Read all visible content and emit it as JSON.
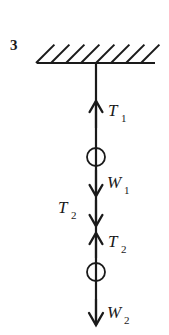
{
  "figure": {
    "number_label": "3",
    "type": "free-body-diagram",
    "canvas": {
      "width": 169,
      "height": 335,
      "background": "#ffffff"
    },
    "ink_color": "#1a1a1a"
  },
  "ceiling": {
    "name": "hatched-ceiling",
    "line": {
      "x1": 37,
      "y1": 63,
      "x2": 155,
      "y2": 63,
      "stroke_width": 2.2
    },
    "hatch": {
      "count": 8,
      "angle_degrees": 45,
      "length": 26,
      "spacing": 15,
      "start_x": 36,
      "stroke_width": 2.0
    }
  },
  "rod": {
    "name": "vertical-string",
    "x": 96,
    "y_top": 63,
    "y_bottom": 325,
    "stroke_width": 2.2
  },
  "masses": [
    {
      "name": "upper-mass",
      "cx": 96,
      "cy": 157,
      "r": 9,
      "stroke_width": 1.8
    },
    {
      "name": "lower-mass",
      "cx": 96,
      "cy": 272,
      "r": 9,
      "stroke_width": 1.8
    }
  ],
  "forces": [
    {
      "id": "T1",
      "name": "tension-T1",
      "symbol": "T",
      "subscript": "1",
      "direction": "up",
      "meaning": "Tension in upper string supporting both masses",
      "shaft": {
        "x": 96,
        "y_tail": 128,
        "y_head": 101
      },
      "head_size": 11,
      "label": {
        "x": 108,
        "y": 116,
        "sub_x": 121,
        "sub_y": 122
      }
    },
    {
      "id": "W1",
      "name": "weight-W1",
      "symbol": "W",
      "subscript": "1",
      "direction": "down",
      "meaning": "Weight of the upper mass",
      "shaft": {
        "x": 96,
        "y_tail": 170,
        "y_head": 196
      },
      "head_size": 11,
      "label": {
        "x": 107,
        "y": 188,
        "sub_x": 124,
        "sub_y": 194
      }
    },
    {
      "id": "T2_down",
      "name": "tension-T2-on-upper-mass",
      "symbol": "T",
      "subscript": "2",
      "direction": "down",
      "meaning": "Downward pull of lower string on the upper mass",
      "shaft": {
        "x": 96,
        "y_tail": 200,
        "y_head": 226
      },
      "head_size": 11,
      "label": {
        "x": 58,
        "y": 213,
        "sub_x": 71,
        "sub_y": 219
      }
    },
    {
      "id": "T2_up",
      "name": "tension-T2-on-lower-mass",
      "symbol": "T",
      "subscript": "2",
      "direction": "up",
      "meaning": "Upward pull of lower string on the lower mass",
      "shaft": {
        "x": 96,
        "y_tail": 258,
        "y_head": 233
      },
      "head_size": 11,
      "label": {
        "x": 108,
        "y": 247,
        "sub_x": 121,
        "sub_y": 253
      }
    },
    {
      "id": "W2",
      "name": "weight-W2",
      "symbol": "W",
      "subscript": "2",
      "direction": "down",
      "meaning": "Weight of the lower mass",
      "shaft": {
        "x": 96,
        "y_tail": 299,
        "y_head": 325
      },
      "head_size": 12,
      "label": {
        "x": 107,
        "y": 318,
        "sub_x": 124,
        "sub_y": 324
      }
    }
  ],
  "figure_number_position": {
    "x": 10,
    "y": 50
  }
}
